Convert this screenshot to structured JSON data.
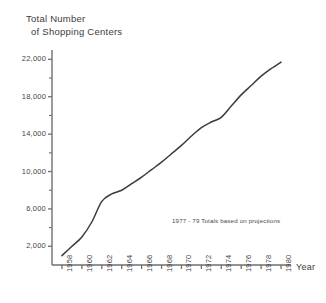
{
  "chart_data": {
    "type": "line",
    "title": "Total Number of Shopping Centers",
    "title_line1": "Total Number",
    "title_line2": "of Shopping Centers",
    "xlabel": "Year",
    "ylabel": "",
    "annotation": "1977 - 79 Totals based on projections",
    "grid": false,
    "legend": "none",
    "xlim": [
      1957,
      1981
    ],
    "ylim": [
      0,
      23000
    ],
    "x_tick_labels": [
      "1958",
      "1960",
      "1962",
      "1964",
      "1966",
      "1968",
      "1970",
      "1972",
      "1974",
      "1976",
      "1978",
      "1980"
    ],
    "y_tick_labels": [
      "2,000",
      "6,000",
      "10,000",
      "14,000",
      "18,000",
      "22,000"
    ],
    "y_major_ticks": [
      2000,
      6000,
      10000,
      14000,
      18000,
      22000
    ],
    "y_minor_ticks": [
      4000,
      8000,
      12000,
      16000,
      20000
    ],
    "x": [
      1958,
      1959,
      1960,
      1961,
      1962,
      1963,
      1964,
      1965,
      1966,
      1967,
      1968,
      1969,
      1970,
      1971,
      1972,
      1973,
      1974,
      1975,
      1976,
      1977,
      1978,
      1979,
      1980
    ],
    "values": [
      1000,
      2000,
      3000,
      4600,
      6800,
      7600,
      8000,
      8700,
      9400,
      10200,
      11000,
      11900,
      12800,
      13800,
      14700,
      15300,
      15800,
      17000,
      18200,
      19200,
      20200,
      21000,
      21700
    ],
    "series": [
      {
        "name": "Total Number of Shopping Centers",
        "values": [
          1000,
          2000,
          3000,
          4600,
          6800,
          7600,
          8000,
          8700,
          9400,
          10200,
          11000,
          11900,
          12800,
          13800,
          14700,
          15300,
          15800,
          17000,
          18200,
          19200,
          20200,
          21000,
          21700
        ]
      }
    ],
    "line_color": "#3b3b3b",
    "axis_color": "#6f6f6f"
  }
}
